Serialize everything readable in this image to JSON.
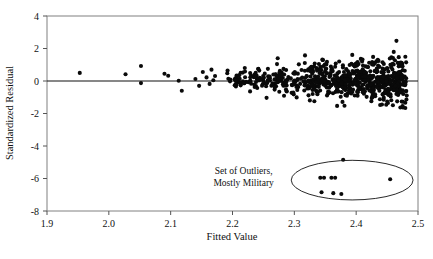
{
  "figure": {
    "background_color": "#ffffff",
    "point_color": "#0a0a0a",
    "frame_color": "#808080",
    "zero_line_color": "#111111"
  },
  "chart_data": {
    "type": "scatter",
    "title": "",
    "xlabel": "Fitted Value",
    "ylabel": "Standardized Residual",
    "xlim": [
      1.9,
      2.5
    ],
    "ylim": [
      -8,
      4
    ],
    "xticks": [
      1.9,
      2.0,
      2.1,
      2.2,
      2.3,
      2.4,
      2.5
    ],
    "xtick_labels": [
      "1.9",
      "2.0",
      "2.1",
      "2.2",
      "2.3",
      "2.4",
      "2.5"
    ],
    "yticks": [
      4,
      2,
      0,
      -2,
      -4,
      -6,
      -8
    ],
    "ytick_labels": [
      "4",
      "2",
      "0",
      "-2",
      "-4",
      "-6",
      "-8"
    ],
    "grid": false,
    "legend": null,
    "reference_lines": [
      {
        "orientation": "horizontal",
        "y": 0,
        "name": "zero-residual-line"
      }
    ],
    "annotations": [
      {
        "name": "outlier-annotation",
        "text_lines": [
          "Set of Outliers,",
          "Mostly Military"
        ],
        "text_x": 2.218,
        "text_y": -5.75,
        "shape": "ellipse",
        "ellipse_center_x": 2.3935,
        "ellipse_center_y": -6.1,
        "ellipse_radius_x": 0.0985,
        "ellipse_radius_y": 1.22
      }
    ],
    "series": [
      {
        "name": "Sparse low-fitted observations",
        "points": [
          [
            1.953,
            0.5
          ],
          [
            2.027,
            0.42
          ],
          [
            2.052,
            0.92
          ],
          [
            2.052,
            -0.13
          ],
          [
            2.09,
            0.45
          ],
          [
            2.096,
            0.32
          ],
          [
            2.113,
            0.02
          ],
          [
            2.118,
            -0.6
          ],
          [
            2.14,
            0.12
          ],
          [
            2.146,
            -0.3
          ],
          [
            2.152,
            0.55
          ],
          [
            2.158,
            0.22
          ],
          [
            2.163,
            -0.18
          ],
          [
            2.166,
            0.7
          ],
          [
            2.169,
            0.05
          ]
        ]
      },
      {
        "name": "Main residual cloud",
        "description": "Dense band of standardized residuals centered near zero, widening from fitted value 2.17 to 2.48, spread approximately -2 to +2.6",
        "n_points": 760,
        "x_range": [
          2.168,
          2.482
        ],
        "y_range": [
          -2.9,
          2.6
        ],
        "y_center": 0.08,
        "y_spread_sd": 0.62
      },
      {
        "name": "Outlier cluster (mostly military)",
        "points": [
          [
            2.379,
            -4.85
          ],
          [
            2.342,
            -5.95
          ],
          [
            2.348,
            -5.95
          ],
          [
            2.36,
            -5.95
          ],
          [
            2.366,
            -5.95
          ],
          [
            2.455,
            -6.05
          ],
          [
            2.344,
            -6.85
          ],
          [
            2.363,
            -6.9
          ],
          [
            2.376,
            -6.95
          ]
        ]
      }
    ]
  }
}
